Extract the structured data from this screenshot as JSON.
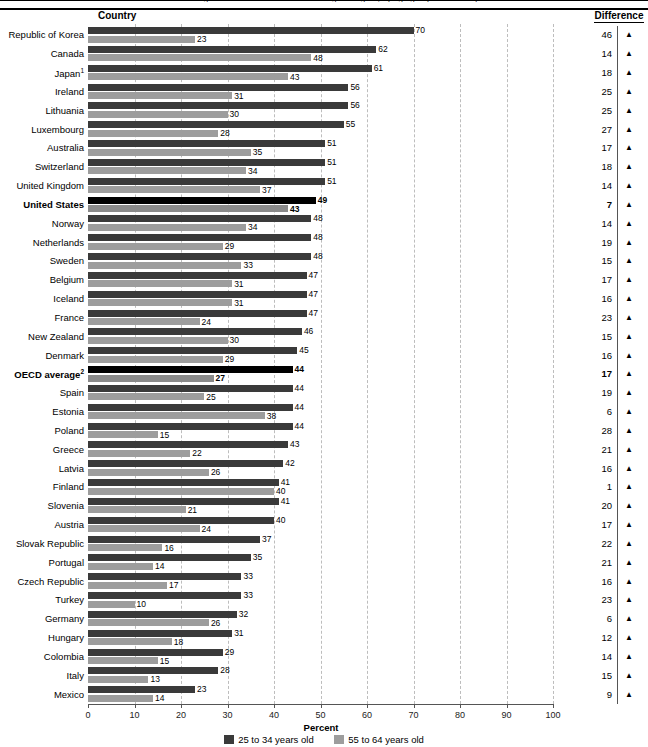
{
  "title_clipped": "Percentage of adults with a bachelor's or higher degree, by age group and country",
  "header": {
    "country_label": "Country",
    "difference_label": "Difference"
  },
  "axis": {
    "title": "Percent",
    "ticks": [
      0,
      10,
      20,
      30,
      40,
      50,
      60,
      70,
      80,
      90,
      100
    ],
    "min": 0,
    "max": 100
  },
  "legend": {
    "young_label": "25 to 34 years old",
    "old_label": "55 to 64 years old",
    "young_color": "#3a3a3a",
    "old_color": "#9d9d9d"
  },
  "arrow_glyph": "▲",
  "chart_data": {
    "type": "bar",
    "orientation": "horizontal",
    "title": "Percentage of adults with a bachelor's or higher degree, by age group and country",
    "xlabel": "Percent",
    "ylabel": "Country",
    "xlim": [
      0,
      100
    ],
    "grid": true,
    "legend_position": "bottom",
    "categories": [
      "Republic of Korea",
      "Canada",
      "Japan¹",
      "Ireland",
      "Lithuania",
      "Luxembourg",
      "Australia",
      "Switzerland",
      "United Kingdom",
      "United States",
      "Norway",
      "Netherlands",
      "Sweden",
      "Belgium",
      "Iceland",
      "France",
      "New Zealand",
      "Denmark",
      "OECD average²",
      "Spain",
      "Estonia",
      "Poland",
      "Greece",
      "Latvia",
      "Finland",
      "Slovenia",
      "Austria",
      "Slovak Republic",
      "Portugal",
      "Czech Republic",
      "Turkey",
      "Germany",
      "Hungary",
      "Colombia",
      "Italy",
      "Mexico"
    ],
    "series": [
      {
        "name": "25 to 34 years old",
        "color": "#3a3a3a",
        "values": [
          70,
          62,
          61,
          56,
          56,
          55,
          51,
          51,
          51,
          49,
          48,
          48,
          48,
          47,
          47,
          47,
          46,
          45,
          44,
          44,
          44,
          44,
          43,
          42,
          41,
          41,
          40,
          37,
          35,
          33,
          33,
          32,
          31,
          29,
          28,
          23
        ]
      },
      {
        "name": "55 to 64 years old",
        "color": "#9d9d9d",
        "values": [
          23,
          48,
          43,
          31,
          30,
          28,
          35,
          34,
          37,
          43,
          34,
          29,
          33,
          31,
          31,
          24,
          30,
          29,
          27,
          25,
          38,
          15,
          22,
          26,
          40,
          21,
          24,
          16,
          14,
          17,
          10,
          26,
          18,
          15,
          13,
          14
        ]
      }
    ],
    "difference": [
      46,
      14,
      18,
      25,
      25,
      27,
      17,
      18,
      14,
      7,
      14,
      19,
      15,
      17,
      16,
      23,
      15,
      16,
      17,
      19,
      6,
      28,
      21,
      16,
      1,
      20,
      17,
      22,
      21,
      16,
      23,
      6,
      12,
      14,
      15,
      9
    ],
    "highlighted_rows": [
      "United States",
      "OECD average²"
    ]
  }
}
